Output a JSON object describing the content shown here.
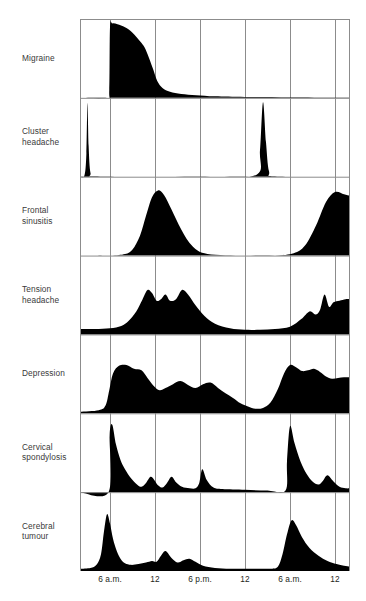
{
  "figure": {
    "title": "",
    "background_color": "#ffffff",
    "fill_color": "#000000",
    "grid_color": "#8c8c8c",
    "axis_color": "#000000",
    "label_color": "#3a3a3a"
  },
  "rows": [
    {
      "id": "migraine",
      "label_line1": "Migraine",
      "label_line2": ""
    },
    {
      "id": "cluster-headache",
      "label_line1": "Cluster",
      "label_line2": "headache"
    },
    {
      "id": "frontal-sinusitis",
      "label_line1": "Frontal",
      "label_line2": "sinusitis"
    },
    {
      "id": "tension-headache",
      "label_line1": "Tension",
      "label_line2": "headache"
    },
    {
      "id": "depression",
      "label_line1": "Depression",
      "label_line2": ""
    },
    {
      "id": "cervical-spondylosis",
      "label_line1": "Cervical",
      "label_line2": "spondylosis"
    },
    {
      "id": "cerebral-tumour",
      "label_line1": "Cerebral",
      "label_line2": "tumour"
    }
  ],
  "x_axis": {
    "tick_labels": [
      "6 a.m.",
      "12",
      "6 p.m.",
      "12",
      "6 a.m.",
      "12"
    ],
    "tick_hours": [
      6,
      12,
      18,
      24,
      30,
      36
    ],
    "range_hours": [
      2,
      38
    ]
  },
  "chart_data": {
    "type": "area",
    "xlabel": "",
    "ylabel": "",
    "xlim": [
      2,
      38
    ],
    "ylim": [
      0,
      1
    ],
    "grid": true,
    "legend": "none",
    "x_tick_labels": [
      "6 a.m.",
      "12",
      "6 p.m.",
      "12",
      "6 a.m.",
      "12"
    ],
    "x_tick_hours": [
      6,
      12,
      18,
      24,
      30,
      36
    ],
    "note": "Each series is an intensity profile (0-1) across 36 hours of the day; x in hours.",
    "series": [
      {
        "name": "Migraine",
        "x": [
          2,
          5.6,
          5.9,
          6.0,
          6.3,
          7.0,
          8.0,
          9.0,
          10.0,
          10.6,
          11.2,
          11.8,
          12.3,
          13.0,
          14.0,
          15.5,
          17.5,
          20.0,
          24.0,
          30.0,
          36.0,
          38.0
        ],
        "values": [
          0,
          0,
          0.1,
          0.92,
          0.97,
          0.96,
          0.92,
          0.85,
          0.74,
          0.66,
          0.52,
          0.36,
          0.22,
          0.13,
          0.08,
          0.05,
          0.035,
          0.02,
          0.012,
          0.008,
          0.005,
          0.004
        ]
      },
      {
        "name": "Cluster headache",
        "x": [
          2,
          2.6,
          2.85,
          3.0,
          3.15,
          3.4,
          4.0,
          12,
          20,
          25.6,
          26.0,
          26.4,
          26.8,
          27.2,
          28.0,
          36,
          38
        ],
        "values": [
          0,
          0.02,
          0.3,
          0.96,
          0.4,
          0.05,
          0.005,
          0,
          0,
          0.03,
          0.35,
          0.97,
          0.45,
          0.07,
          0.005,
          0,
          0
        ]
      },
      {
        "name": "Frontal sinusitis",
        "x": [
          2,
          6,
          8,
          9.0,
          10.0,
          10.8,
          11.6,
          12.4,
          13.2,
          14.2,
          15.5,
          17,
          19,
          24,
          28,
          30.5,
          32.0,
          33.5,
          34.8,
          36.0,
          37.2,
          38
        ],
        "values": [
          0,
          0,
          0.02,
          0.08,
          0.26,
          0.52,
          0.76,
          0.85,
          0.79,
          0.6,
          0.34,
          0.12,
          0.02,
          0,
          0,
          0.03,
          0.13,
          0.4,
          0.7,
          0.83,
          0.8,
          0.78
        ]
      },
      {
        "name": "Tension headache",
        "x": [
          2,
          4,
          6,
          7.5,
          8.5,
          9.5,
          10.3,
          11.0,
          11.6,
          12.2,
          12.8,
          13.4,
          14.0,
          14.8,
          15.6,
          16.4,
          17.4,
          18.6,
          20,
          22,
          24,
          26,
          28,
          30,
          31.5,
          32.6,
          33.4,
          34.0,
          34.6,
          35.2,
          35.8,
          36.6,
          37.4,
          38
        ],
        "values": [
          0.07,
          0.07,
          0.08,
          0.11,
          0.18,
          0.3,
          0.45,
          0.58,
          0.54,
          0.44,
          0.46,
          0.52,
          0.44,
          0.46,
          0.58,
          0.52,
          0.38,
          0.24,
          0.14,
          0.08,
          0.06,
          0.06,
          0.07,
          0.1,
          0.2,
          0.3,
          0.26,
          0.32,
          0.52,
          0.36,
          0.42,
          0.44,
          0.46,
          0.46
        ]
      },
      {
        "name": "Depression",
        "x": [
          2,
          4.5,
          5.4,
          5.9,
          6.4,
          7.2,
          8.2,
          9.2,
          10.2,
          11.0,
          11.8,
          12.6,
          13.4,
          14.4,
          15.4,
          16.4,
          17.4,
          18.4,
          19.4,
          20.4,
          21.4,
          22.4,
          23.4,
          24.4,
          25.4,
          26.4,
          27.4,
          28.4,
          29.2,
          30.0,
          30.8,
          31.6,
          32.4,
          33.2,
          34.0,
          34.8,
          35.6,
          36.4,
          37.2,
          38
        ],
        "values": [
          0.02,
          0.04,
          0.1,
          0.3,
          0.52,
          0.62,
          0.63,
          0.58,
          0.56,
          0.46,
          0.36,
          0.3,
          0.33,
          0.38,
          0.42,
          0.37,
          0.33,
          0.38,
          0.4,
          0.33,
          0.26,
          0.2,
          0.13,
          0.09,
          0.06,
          0.07,
          0.14,
          0.32,
          0.52,
          0.63,
          0.6,
          0.55,
          0.56,
          0.58,
          0.54,
          0.48,
          0.45,
          0.46,
          0.47,
          0.47
        ]
      },
      {
        "name": "Cervical spondylosis",
        "x": [
          2,
          5.8,
          5.95,
          6.3,
          6.8,
          7.4,
          8.0,
          8.8,
          9.6,
          10.2,
          10.8,
          11.4,
          11.9,
          12.4,
          13.0,
          13.6,
          14.2,
          14.8,
          15.6,
          16.6,
          17.4,
          17.9,
          18.3,
          18.9,
          19.8,
          21,
          24,
          27,
          29.4,
          29.6,
          30.0,
          30.6,
          31.4,
          32.2,
          33.0,
          33.8,
          34.4,
          35.0,
          35.8,
          36.6,
          37.4,
          38
        ],
        "values": [
          0,
          0,
          0.74,
          0.88,
          0.62,
          0.42,
          0.3,
          0.18,
          0.1,
          0.07,
          0.12,
          0.2,
          0.16,
          0.09,
          0.06,
          0.12,
          0.2,
          0.13,
          0.07,
          0.05,
          0.05,
          0.12,
          0.3,
          0.16,
          0.06,
          0.04,
          0.03,
          0.02,
          0.02,
          0.4,
          0.86,
          0.64,
          0.4,
          0.24,
          0.14,
          0.1,
          0.15,
          0.22,
          0.14,
          0.07,
          0.05,
          0.05
        ]
      },
      {
        "name": "Cerebral tumour",
        "x": [
          2,
          3.4,
          4.2,
          4.8,
          5.2,
          5.6,
          6.0,
          6.4,
          6.9,
          7.4,
          8.0,
          8.8,
          9.8,
          10.8,
          11.6,
          12.2,
          12.8,
          13.4,
          14.2,
          15.0,
          15.8,
          16.6,
          17.4,
          18.4,
          20,
          22,
          24,
          26,
          27.5,
          28.4,
          29.0,
          29.6,
          30.2,
          30.8,
          31.6,
          32.6,
          33.8,
          35.0,
          36.2,
          37.2,
          38
        ],
        "values": [
          0.03,
          0.04,
          0.08,
          0.22,
          0.52,
          0.74,
          0.62,
          0.42,
          0.26,
          0.16,
          0.1,
          0.08,
          0.09,
          0.11,
          0.13,
          0.12,
          0.2,
          0.26,
          0.17,
          0.11,
          0.14,
          0.16,
          0.12,
          0.07,
          0.04,
          0.03,
          0.03,
          0.03,
          0.03,
          0.06,
          0.22,
          0.48,
          0.66,
          0.6,
          0.44,
          0.3,
          0.2,
          0.13,
          0.09,
          0.07,
          0.06
        ]
      }
    ]
  }
}
